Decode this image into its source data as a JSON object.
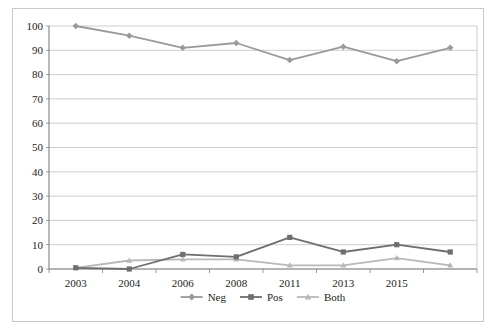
{
  "chart_data": {
    "type": "line",
    "title": "",
    "subtitle": "",
    "xlabel": "",
    "ylabel": "",
    "categories": [
      "2003",
      "2004",
      "2006",
      "2008",
      "2011",
      "2013",
      "2015",
      ""
    ],
    "xtick_labels": [
      "2003",
      "2004",
      "2006",
      "2008",
      "2011",
      "2013",
      "2015"
    ],
    "ytick_labels": [
      "0",
      "10",
      "20",
      "30",
      "40",
      "50",
      "60",
      "70",
      "80",
      "90",
      "100"
    ],
    "ylim": [
      0,
      100
    ],
    "ytick_step": 10,
    "grid": "horizontal",
    "legend_position": "bottom-center",
    "series": [
      {
        "name": "Neg",
        "marker": "diamond",
        "color": "#9a9a9a",
        "values": [
          100,
          96,
          91,
          93,
          86,
          91.5,
          85.5,
          91
        ]
      },
      {
        "name": "Pos",
        "marker": "square",
        "color": "#6e6e6e",
        "values": [
          0.5,
          0,
          6,
          5,
          13,
          7,
          10,
          7
        ]
      },
      {
        "name": "Both",
        "marker": "triangle",
        "color": "#b8b8b8",
        "values": [
          0.5,
          3.5,
          4,
          4,
          1.5,
          1.5,
          4.5,
          1.5
        ]
      }
    ]
  },
  "colors": {
    "frame_border": "#c9c9c9",
    "axis": "#808080",
    "gridline": "#c0c0c0",
    "plot_background": "#ffffff",
    "text": "#1d1d1d"
  },
  "legend": {
    "items": [
      {
        "label": "Neg",
        "marker": "diamond",
        "color": "#9a9a9a"
      },
      {
        "label": "Pos",
        "marker": "square",
        "color": "#6e6e6e"
      },
      {
        "label": "Both",
        "marker": "triangle",
        "color": "#b8b8b8"
      }
    ]
  }
}
